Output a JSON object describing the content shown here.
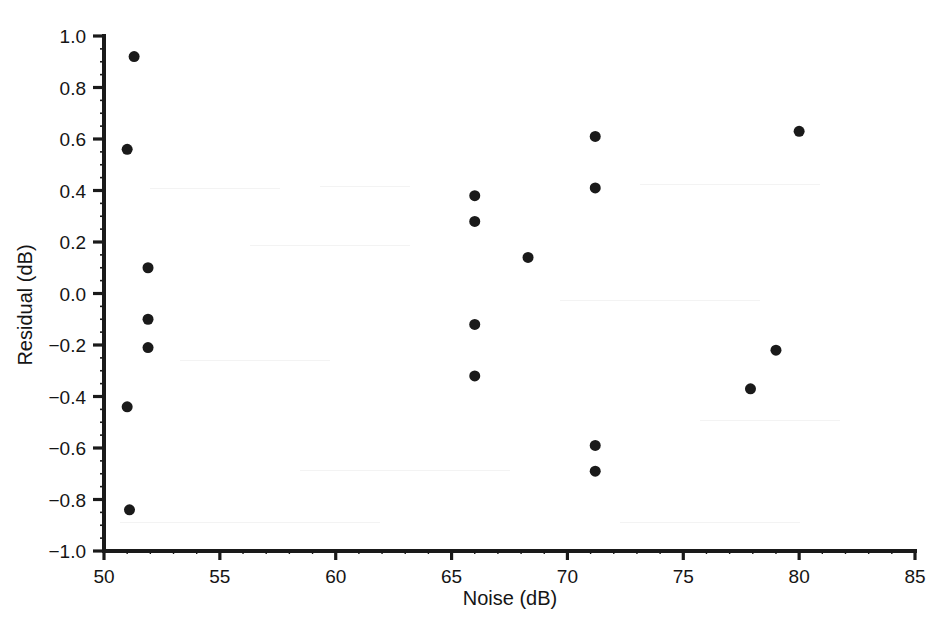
{
  "chart_data": {
    "type": "scatter",
    "title": "",
    "xlabel": "Noise (dB)",
    "ylabel": "Residual (dB)",
    "xlim": [
      50,
      85
    ],
    "ylim": [
      -1.0,
      1.0
    ],
    "grid": false,
    "legend": null,
    "marker": {
      "shape": "circle",
      "color": "#1a1a1a",
      "size_px": 11
    },
    "xticks": [
      50,
      55,
      60,
      65,
      70,
      75,
      80,
      85
    ],
    "xtick_labels": [
      "50",
      "55",
      "60",
      "65",
      "70",
      "75",
      "80",
      "85"
    ],
    "yticks": [
      -1.0,
      -0.8,
      -0.6,
      -0.4,
      -0.2,
      0.0,
      0.2,
      0.4,
      0.6,
      0.8,
      1.0
    ],
    "ytick_labels": [
      "−1.0",
      "−0.8",
      "−0.6",
      "−0.4",
      "−0.2",
      "0.0",
      "0.2",
      "0.4",
      "0.6",
      "0.8",
      "1.0"
    ],
    "x_minor_tick_interval": 1,
    "y_minor_tick_interval": 0.05,
    "n_points": 19,
    "points": [
      {
        "x": 51.3,
        "y": 0.92
      },
      {
        "x": 51.0,
        "y": 0.56
      },
      {
        "x": 51.9,
        "y": 0.1
      },
      {
        "x": 51.9,
        "y": -0.1
      },
      {
        "x": 51.9,
        "y": -0.21
      },
      {
        "x": 51.0,
        "y": -0.44
      },
      {
        "x": 51.1,
        "y": -0.84
      },
      {
        "x": 66.0,
        "y": 0.38
      },
      {
        "x": 66.0,
        "y": 0.28
      },
      {
        "x": 66.0,
        "y": -0.12
      },
      {
        "x": 66.0,
        "y": -0.32
      },
      {
        "x": 68.3,
        "y": 0.14
      },
      {
        "x": 71.2,
        "y": 0.61
      },
      {
        "x": 71.2,
        "y": 0.41
      },
      {
        "x": 71.2,
        "y": -0.59
      },
      {
        "x": 71.2,
        "y": -0.69
      },
      {
        "x": 77.9,
        "y": -0.37
      },
      {
        "x": 79.0,
        "y": -0.22
      },
      {
        "x": 80.0,
        "y": 0.63
      }
    ]
  },
  "figure": {
    "background_color": "#ffffff",
    "axis_color": "#1a1a1a",
    "marker_color": "#1a1a1a"
  }
}
